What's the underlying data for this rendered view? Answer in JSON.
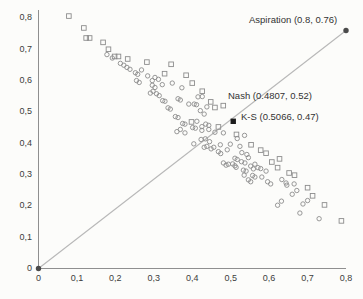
{
  "chart_data": {
    "type": "scatter",
    "title": "",
    "xlabel": "",
    "ylabel": "",
    "xlim": [
      0,
      0.8
    ],
    "ylim": [
      0,
      0.8
    ],
    "grid": false,
    "x_ticks": {
      "values": [
        0,
        0.1,
        0.2,
        0.3,
        0.4,
        0.5,
        0.6,
        0.7,
        0.8
      ],
      "labels": [
        "0",
        "0,1",
        "0,2",
        "0,3",
        "0,4",
        "0,5",
        "0,6",
        "0,7",
        "0,8"
      ]
    },
    "y_ticks": {
      "values": [
        0,
        0.1,
        0.2,
        0.3,
        0.4,
        0.5,
        0.6,
        0.7,
        0.8
      ],
      "labels": [
        "0",
        "0,1",
        "0,2",
        "0,3",
        "0,4",
        "0,5",
        "0,6",
        "0,7",
        "0,8"
      ]
    },
    "diagonal_line": {
      "from": [
        0,
        0
      ],
      "to": [
        0.8,
        0.76
      ],
      "color": "#b8b8b8"
    },
    "annotations": [
      {
        "name": "aspiration",
        "text": "Aspiration (0.8, 0.76)",
        "point": [
          0.8,
          0.76
        ]
      },
      {
        "name": "nash",
        "text": "Nash (0.4807, 0.52)",
        "point": [
          0.4807,
          0.52
        ]
      },
      {
        "name": "kalai-smorodinsky",
        "text": "K-S (0.5066, 0.47)",
        "point": [
          0.5066,
          0.47
        ]
      }
    ],
    "series": [
      {
        "name": "offers-squares",
        "marker": "open-square",
        "points": [
          [
            0.079,
            0.806
          ],
          [
            0.118,
            0.768
          ],
          [
            0.124,
            0.736
          ],
          [
            0.133,
            0.736
          ],
          [
            0.168,
            0.722
          ],
          [
            0.182,
            0.7
          ],
          [
            0.198,
            0.677
          ],
          [
            0.208,
            0.677
          ],
          [
            0.232,
            0.669
          ],
          [
            0.282,
            0.659
          ],
          [
            0.345,
            0.652
          ],
          [
            0.328,
            0.622
          ],
          [
            0.384,
            0.617
          ],
          [
            0.4,
            0.592
          ],
          [
            0.426,
            0.566
          ],
          [
            0.448,
            0.532
          ],
          [
            0.459,
            0.514
          ],
          [
            0.398,
            0.468
          ],
          [
            0.468,
            0.452
          ],
          [
            0.515,
            0.428
          ],
          [
            0.553,
            0.395
          ],
          [
            0.578,
            0.378
          ],
          [
            0.592,
            0.368
          ],
          [
            0.627,
            0.35
          ],
          [
            0.607,
            0.34
          ],
          [
            0.622,
            0.322
          ],
          [
            0.652,
            0.305
          ],
          [
            0.666,
            0.298
          ],
          [
            0.7,
            0.258
          ],
          [
            0.713,
            0.232
          ],
          [
            0.744,
            0.203
          ],
          [
            0.788,
            0.152
          ]
        ]
      },
      {
        "name": "offers-circles",
        "marker": "open-circle",
        "points": [
          [
            0.178,
            0.683
          ],
          [
            0.192,
            0.672
          ],
          [
            0.213,
            0.655
          ],
          [
            0.222,
            0.649
          ],
          [
            0.23,
            0.642
          ],
          [
            0.238,
            0.636
          ],
          [
            0.252,
            0.625
          ],
          [
            0.258,
            0.62
          ],
          [
            0.268,
            0.634
          ],
          [
            0.284,
            0.615
          ],
          [
            0.255,
            0.6
          ],
          [
            0.262,
            0.594
          ],
          [
            0.296,
            0.6
          ],
          [
            0.303,
            0.61
          ],
          [
            0.312,
            0.604
          ],
          [
            0.296,
            0.585
          ],
          [
            0.303,
            0.578
          ],
          [
            0.322,
            0.587
          ],
          [
            0.348,
            0.592
          ],
          [
            0.298,
            0.566
          ],
          [
            0.291,
            0.56
          ],
          [
            0.307,
            0.558
          ],
          [
            0.314,
            0.552
          ],
          [
            0.373,
            0.577
          ],
          [
            0.323,
            0.536
          ],
          [
            0.329,
            0.534
          ],
          [
            0.363,
            0.542
          ],
          [
            0.369,
            0.538
          ],
          [
            0.426,
            0.549
          ],
          [
            0.415,
            0.548
          ],
          [
            0.391,
            0.525
          ],
          [
            0.405,
            0.525
          ],
          [
            0.411,
            0.523
          ],
          [
            0.337,
            0.513
          ],
          [
            0.343,
            0.509
          ],
          [
            0.421,
            0.504
          ],
          [
            0.431,
            0.493
          ],
          [
            0.438,
            0.516
          ],
          [
            0.356,
            0.485
          ],
          [
            0.363,
            0.482
          ],
          [
            0.375,
            0.463
          ],
          [
            0.381,
            0.461
          ],
          [
            0.412,
            0.47
          ],
          [
            0.401,
            0.45
          ],
          [
            0.408,
            0.448
          ],
          [
            0.425,
            0.453
          ],
          [
            0.435,
            0.461
          ],
          [
            0.443,
            0.457
          ],
          [
            0.36,
            0.437
          ],
          [
            0.369,
            0.444
          ],
          [
            0.381,
            0.433
          ],
          [
            0.425,
            0.441
          ],
          [
            0.443,
            0.444
          ],
          [
            0.459,
            0.435
          ],
          [
            0.481,
            0.433
          ],
          [
            0.536,
            0.425
          ],
          [
            0.517,
            0.415
          ],
          [
            0.423,
            0.412
          ],
          [
            0.434,
            0.414
          ],
          [
            0.445,
            0.405
          ],
          [
            0.404,
            0.398
          ],
          [
            0.431,
            0.387
          ],
          [
            0.438,
            0.39
          ],
          [
            0.449,
            0.382
          ],
          [
            0.456,
            0.387
          ],
          [
            0.473,
            0.395
          ],
          [
            0.499,
            0.397
          ],
          [
            0.524,
            0.39
          ],
          [
            0.491,
            0.379
          ],
          [
            0.468,
            0.373
          ],
          [
            0.474,
            0.367
          ],
          [
            0.529,
            0.37
          ],
          [
            0.542,
            0.364
          ],
          [
            0.546,
            0.354
          ],
          [
            0.511,
            0.352
          ],
          [
            0.517,
            0.348
          ],
          [
            0.528,
            0.341
          ],
          [
            0.537,
            0.337
          ],
          [
            0.505,
            0.334
          ],
          [
            0.511,
            0.328
          ],
          [
            0.481,
            0.337
          ],
          [
            0.488,
            0.33
          ],
          [
            0.494,
            0.333
          ],
          [
            0.514,
            0.323
          ],
          [
            0.563,
            0.333
          ],
          [
            0.571,
            0.322
          ],
          [
            0.578,
            0.319
          ],
          [
            0.592,
            0.311
          ],
          [
            0.533,
            0.314
          ],
          [
            0.54,
            0.311
          ],
          [
            0.552,
            0.327
          ],
          [
            0.559,
            0.318
          ],
          [
            0.557,
            0.297
          ],
          [
            0.563,
            0.292
          ],
          [
            0.535,
            0.298
          ],
          [
            0.546,
            0.283
          ],
          [
            0.552,
            0.277
          ],
          [
            0.581,
            0.292
          ],
          [
            0.596,
            0.277
          ],
          [
            0.604,
            0.27
          ],
          [
            0.633,
            0.284
          ],
          [
            0.644,
            0.273
          ],
          [
            0.646,
            0.266
          ],
          [
            0.665,
            0.27
          ],
          [
            0.66,
            0.237
          ],
          [
            0.672,
            0.249
          ],
          [
            0.632,
            0.215
          ],
          [
            0.622,
            0.202
          ],
          [
            0.688,
            0.206
          ],
          [
            0.68,
            0.177
          ],
          [
            0.7,
            0.217
          ],
          [
            0.73,
            0.159
          ]
        ]
      },
      {
        "name": "aspiration-point",
        "marker": "filled-circle",
        "points": [
          [
            0.8,
            0.76
          ]
        ]
      },
      {
        "name": "origin-point",
        "marker": "filled-circle",
        "points": [
          [
            0,
            0
          ]
        ]
      },
      {
        "name": "nash-point",
        "marker": "open-square",
        "points": [
          [
            0.4807,
            0.52
          ]
        ]
      },
      {
        "name": "ks-point",
        "marker": "filled-square",
        "points": [
          [
            0.5066,
            0.47
          ]
        ]
      }
    ],
    "colors": {
      "marker_stroke": "#8c8c8c",
      "special_fill": "#4a4a4a",
      "ks_fill": "#1c1c1c",
      "axis": "#8f8f8f",
      "text": "#3c3c3c",
      "line": "#b8b8b8"
    }
  }
}
